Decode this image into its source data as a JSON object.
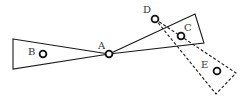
{
  "diagram": {
    "colors": {
      "stroke": "#1a1a1a",
      "point_stroke": "#111111",
      "label": "#333333",
      "background": "#ffffff"
    },
    "left_wedge": {
      "points": [
        [
          13,
          39
        ],
        [
          109,
          54
        ],
        [
          13,
          69
        ]
      ],
      "style": "solid"
    },
    "right_wedge": {
      "points": [
        [
          109,
          54
        ],
        [
          195,
          14
        ],
        [
          204,
          43
        ]
      ],
      "style": "solid"
    },
    "dashed_wedge": {
      "points": [
        [
          155,
          19
        ],
        [
          236,
          73
        ],
        [
          216,
          94
        ]
      ],
      "style": "dashed"
    },
    "points": [
      {
        "label": "A",
        "cx": 109,
        "cy": 54,
        "lx": 98,
        "ly": 49
      },
      {
        "label": "B",
        "cx": 43,
        "cy": 54,
        "lx": 28,
        "ly": 55
      },
      {
        "label": "C",
        "cx": 181,
        "cy": 36,
        "lx": 184,
        "ly": 31
      },
      {
        "label": "D",
        "cx": 155,
        "cy": 19,
        "lx": 143,
        "ly": 13
      },
      {
        "label": "E",
        "cx": 217,
        "cy": 71,
        "lx": 201,
        "ly": 68
      }
    ]
  }
}
